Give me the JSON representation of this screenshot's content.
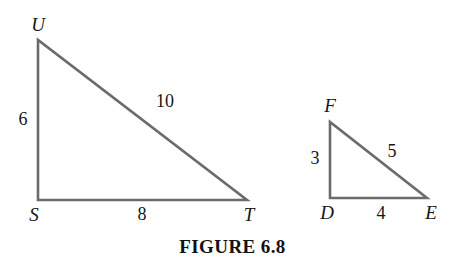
{
  "figure": {
    "caption": "FIGURE 6.8",
    "stroke_color": "#6b6b6b",
    "label_color": "#161616",
    "background_color": "#ffffff",
    "triangles": [
      {
        "name": "triangle-STU",
        "vertices": [
          {
            "label": "U",
            "x": 38,
            "y": 40
          },
          {
            "label": "S",
            "x": 38,
            "y": 200
          },
          {
            "label": "T",
            "x": 247,
            "y": 200
          }
        ],
        "sides": [
          {
            "name": "leg-SU",
            "length": "6"
          },
          {
            "name": "base-ST",
            "length": "8"
          },
          {
            "name": "hypotenuse-UT",
            "length": "10"
          }
        ]
      },
      {
        "name": "triangle-DEF",
        "vertices": [
          {
            "label": "F",
            "x": 330,
            "y": 122
          },
          {
            "label": "D",
            "x": 330,
            "y": 198
          },
          {
            "label": "E",
            "x": 427,
            "y": 198
          }
        ],
        "sides": [
          {
            "name": "leg-DF",
            "length": "3"
          },
          {
            "name": "base-DE",
            "length": "4"
          },
          {
            "name": "hypotenuse-FE",
            "length": "5"
          }
        ]
      }
    ]
  }
}
